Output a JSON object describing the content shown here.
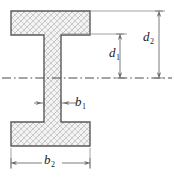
{
  "figure": {
    "name": "i-beam-cross-section",
    "background_color": "#ffffff",
    "outline_color": "#5a5a5a",
    "hatch_color": "#b9b9b9",
    "fill_color": "#f2f2f2",
    "dimension_line_color": "#6e6e6e",
    "centerline_color": "#4a4a4a",
    "text_color": "#1b1b1b"
  },
  "geometry": {
    "top_flange": {
      "x": 11,
      "y": 11,
      "width": 79,
      "height": 24
    },
    "bottom_flange": {
      "x": 11,
      "y": 122,
      "width": 79,
      "height": 24
    },
    "web": {
      "x": 44,
      "y": 35,
      "width": 17,
      "height": 87
    },
    "centerline_y": 78,
    "centerline_x_start": 2,
    "centerline_x_end": 172
  },
  "dimensions": [
    {
      "id": "d1",
      "label": "d",
      "subscript": "1",
      "orientation": "vertical",
      "meaning": "half-depth to inner face of top flange",
      "line_x": 120,
      "from_y": 33,
      "to_y": 78
    },
    {
      "id": "d2",
      "label": "d",
      "subscript": "2",
      "orientation": "vertical",
      "meaning": "half-depth overall to outer face of top flange",
      "line_x": 159,
      "from_y": 11,
      "to_y": 78
    },
    {
      "id": "b1",
      "label": "b",
      "subscript": "1",
      "orientation": "horizontal",
      "meaning": "web thickness",
      "line_y": 103,
      "from_x": 44,
      "to_x": 61
    },
    {
      "id": "b2",
      "label": "b",
      "subscript": "2",
      "orientation": "horizontal",
      "meaning": "flange width",
      "line_y": 163,
      "from_x": 11,
      "to_x": 90
    }
  ]
}
